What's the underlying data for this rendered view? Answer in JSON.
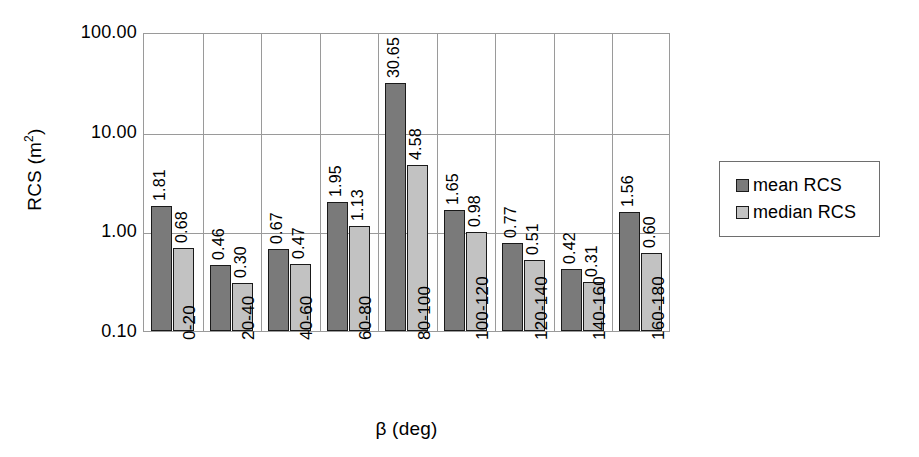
{
  "chart_data": {
    "type": "bar",
    "title": "",
    "xlabel": "β (deg)",
    "ylabel": "RCS (m²)",
    "ylabel_base": "RCS (m",
    "ylabel_sup": "2",
    "ylabel_close": ")",
    "yscale": "log",
    "ylim": [
      0.1,
      100
    ],
    "ytick_labels": [
      "100.00",
      "10.00",
      "1.00",
      "0.10"
    ],
    "ytick_values": [
      100,
      10,
      1,
      0.1
    ],
    "grid": "both",
    "legend_position": "right",
    "categories": [
      "0-20",
      "20-40",
      "40-60",
      "60-80",
      "80-100",
      "100-120",
      "120-140",
      "140-160",
      "160-180"
    ],
    "series": [
      {
        "name": "mean RCS",
        "color": "#7a7a7a",
        "values": [
          1.81,
          0.46,
          0.67,
          1.95,
          30.65,
          1.65,
          0.77,
          0.42,
          1.56
        ],
        "labels": [
          "1.81",
          "0.46",
          "0.67",
          "1.95",
          "30.65",
          "1.65",
          "0.77",
          "0.42",
          "1.56"
        ]
      },
      {
        "name": "median RCS",
        "color": "#c2c2c2",
        "values": [
          0.68,
          0.3,
          0.47,
          1.13,
          4.58,
          0.98,
          0.51,
          0.31,
          0.6
        ],
        "labels": [
          "0.68",
          "0.30",
          "0.47",
          "1.13",
          "4.58",
          "0.98",
          "0.51",
          "0.31",
          "0.60"
        ]
      }
    ]
  },
  "legend": {
    "items": [
      {
        "label": "mean RCS",
        "swatch": "mean"
      },
      {
        "label": "median RCS",
        "swatch": "median"
      }
    ]
  }
}
